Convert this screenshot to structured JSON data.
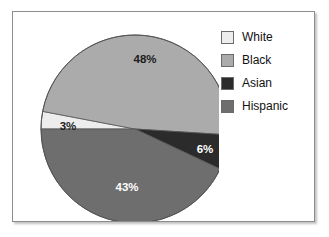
{
  "chart_data": {
    "type": "pie",
    "title": "",
    "categories": [
      "White",
      "Black",
      "Asian",
      "Hispanic"
    ],
    "values": [
      3,
      48,
      6,
      43
    ],
    "value_labels": [
      "3%",
      "48%",
      "6%",
      "43%"
    ],
    "units": "percent",
    "total": 100,
    "legend_position": "right",
    "grid": false,
    "colors": {
      "white_slice": "#ededed",
      "black_slice": "#ababab",
      "asian_slice": "#2b2b2b",
      "hispanic_slice": "#6e6e6e"
    },
    "slices": [
      {
        "name": "White",
        "value": 3,
        "label": "3%",
        "color": "#ededed",
        "label_color": "#1d1d1d",
        "start_angle": 180,
        "end_angle": 190.8,
        "label_x": 49,
        "label_y": 115
      },
      {
        "name": "Black",
        "value": 48,
        "label": "48%",
        "color": "#ababab",
        "label_color": "#1d1d1d",
        "start_angle": 190.8,
        "end_angle": 363.6,
        "label_x": 126,
        "label_y": 48
      },
      {
        "name": "Asian",
        "value": 6,
        "label": "6%",
        "color": "#2b2b2b",
        "label_color": "#ffffff",
        "start_angle": 363.6,
        "end_angle": 385.2,
        "label_x": 186,
        "label_y": 138
      },
      {
        "name": "Hispanic",
        "value": 43,
        "label": "43%",
        "color": "#6e6e6e",
        "label_color": "#ffffff",
        "start_angle": 385.2,
        "end_angle": 540,
        "label_x": 108,
        "label_y": 176
      }
    ],
    "geometry": {
      "center_x": 116,
      "center_y": 117,
      "radius": 94,
      "outline_color": "#555555"
    }
  },
  "legend": {
    "items": [
      {
        "label": "White",
        "swatch": "#ededed"
      },
      {
        "label": "Black",
        "swatch": "#ababab"
      },
      {
        "label": "Asian",
        "swatch": "#2b2b2b"
      },
      {
        "label": "Hispanic",
        "swatch": "#6e6e6e"
      }
    ]
  }
}
